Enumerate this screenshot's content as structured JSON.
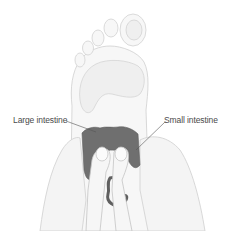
{
  "diagram": {
    "labels": [
      {
        "id": "large",
        "text": "Large intestine"
      },
      {
        "id": "small",
        "text": "Small intestine"
      }
    ],
    "colors": {
      "background": "#ffffff",
      "outline": "#c8c8c8",
      "foot_fill": "#f6f6f6",
      "arch_fill": "#eeeeee",
      "intestine_zone": "#6e6e6e",
      "label_text": "#4a4a4a",
      "leader_line": "#555555"
    }
  }
}
